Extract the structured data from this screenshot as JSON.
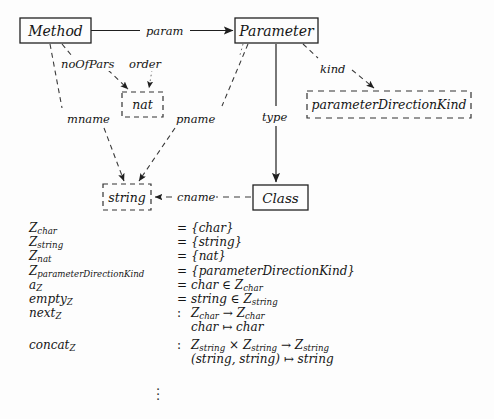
{
  "diagram": {
    "nodes": [
      {
        "id": "method",
        "label": "Method",
        "style": "solid",
        "x": 20,
        "y": 18,
        "w": 71,
        "h": 25
      },
      {
        "id": "parameter",
        "label": "Parameter",
        "style": "solid",
        "x": 235,
        "y": 18,
        "w": 83,
        "h": 25
      },
      {
        "id": "nat",
        "label": "nat",
        "style": "dashed",
        "x": 122,
        "y": 92,
        "w": 41,
        "h": 25
      },
      {
        "id": "parameterDirectionKind",
        "label": "parameterDirectionKind",
        "style": "dashed",
        "x": 307,
        "y": 91,
        "w": 164,
        "h": 27
      },
      {
        "id": "string",
        "label": "string",
        "style": "dashed",
        "x": 103,
        "y": 184,
        "w": 48,
        "h": 26
      },
      {
        "id": "class",
        "label": "Class",
        "style": "solid",
        "x": 253,
        "y": 185,
        "w": 55,
        "h": 25
      }
    ],
    "edges": [
      {
        "id": "param",
        "label": "param",
        "from": "method",
        "to": "parameter",
        "style": "solid",
        "label_x": 145,
        "label_y": 24
      },
      {
        "id": "noOfPars",
        "label": "noOfPars",
        "from": "method",
        "to": "nat",
        "style": "dashed",
        "label_x": 62,
        "label_y": 57
      },
      {
        "id": "order",
        "label": "order",
        "from": "parameter",
        "to": "nat",
        "style": "dotted",
        "label_x": 130,
        "label_y": 57
      },
      {
        "id": "mname",
        "label": "mname",
        "from": "method",
        "to": "string",
        "style": "dashed",
        "label_x": 67,
        "label_y": 112
      },
      {
        "id": "pname",
        "label": "pname",
        "from": "parameter",
        "to": "string",
        "style": "dashed",
        "label_x": 175,
        "label_y": 112
      },
      {
        "id": "type",
        "label": "type",
        "from": "parameter",
        "to": "class",
        "style": "solid",
        "label_x": 262,
        "label_y": 110
      },
      {
        "id": "kind",
        "label": "kind",
        "from": "parameter",
        "to": "parameterDirectionKind",
        "style": "dashed",
        "label_x": 319,
        "label_y": 62
      },
      {
        "id": "cname",
        "label": "cname",
        "from": "class",
        "to": "string",
        "style": "dashed",
        "label_x": 176,
        "label_y": 190
      }
    ]
  },
  "equations": {
    "rows": [
      {
        "lhs": "Z",
        "lhs_sub": "char",
        "op": "=",
        "rhs": "{char}",
        "rhs_sub": ""
      },
      {
        "lhs": "Z",
        "lhs_sub": "string",
        "op": "=",
        "rhs": "{string}",
        "rhs_sub": ""
      },
      {
        "lhs": "Z",
        "lhs_sub": "nat",
        "op": "=",
        "rhs": "{nat}",
        "rhs_sub": ""
      },
      {
        "lhs": "Z",
        "lhs_sub": "parameterDirectionKind",
        "op": "=",
        "rhs": "{parameterDirectionKind}",
        "rhs_sub": ""
      },
      {
        "lhs": "a",
        "lhs_sub": "Z",
        "op": "=",
        "rhs": "char ∈ Z",
        "rhs_sub": "char"
      },
      {
        "lhs": "empty",
        "lhs_sub": "Z",
        "op": "=",
        "rhs": "string ∈ Z",
        "rhs_sub": "string"
      },
      {
        "lhs": "next",
        "lhs_sub": "Z",
        "op": ":",
        "rhs": "Z",
        "rhs_sub": "char",
        "rhs_tail": " → Z",
        "rhs_tail_sub": "char"
      },
      {
        "lhs": "",
        "lhs_sub": "",
        "op": "",
        "rhs": "char ↦ char",
        "rhs_sub": ""
      },
      {
        "lhs": "concat",
        "lhs_sub": "Z",
        "op": ":",
        "rhs": "Z",
        "rhs_sub": "string",
        "rhs_tail": " × Z",
        "rhs_tail_sub": "string",
        "rhs_tail2": " → Z",
        "rhs_tail2_sub": "string"
      },
      {
        "lhs": "",
        "lhs_sub": "",
        "op": "",
        "rhs": "(string, string) ↦ string",
        "rhs_sub": ""
      }
    ],
    "continuation": "⋮"
  },
  "colors": {
    "ink": "#151515",
    "paper": "#fdfdfd",
    "line": "#2a2a2a"
  }
}
